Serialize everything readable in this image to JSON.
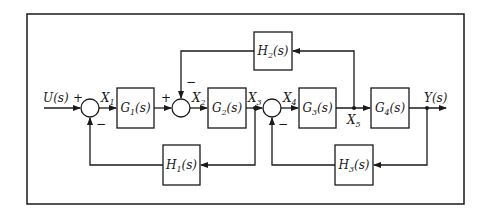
{
  "diagram": {
    "type": "control-system-block-diagram",
    "input": {
      "name": "U",
      "arg": "(s)"
    },
    "output": {
      "name": "Y",
      "arg": "(s)"
    },
    "forward_blocks": [
      {
        "id": "G1",
        "name": "G",
        "sub": "1",
        "arg": "(s)"
      },
      {
        "id": "G2",
        "name": "G",
        "sub": "2",
        "arg": "(s)"
      },
      {
        "id": "G3",
        "name": "G",
        "sub": "3",
        "arg": "(s)"
      },
      {
        "id": "G4",
        "name": "G",
        "sub": "4",
        "arg": "(s)"
      }
    ],
    "feedback_blocks": [
      {
        "id": "H1",
        "name": "H",
        "sub": "1",
        "arg": "(s)",
        "from": "X3",
        "to": "sum1"
      },
      {
        "id": "H2",
        "name": "H",
        "sub": "2",
        "arg": "(s)",
        "from": "X5",
        "to": "sum2"
      },
      {
        "id": "H3",
        "name": "H",
        "sub": "3",
        "arg": "(s)",
        "from": "Y",
        "to": "sum3"
      }
    ],
    "signals": [
      {
        "name": "X",
        "sub": "1"
      },
      {
        "name": "X",
        "sub": "2"
      },
      {
        "name": "X",
        "sub": "3"
      },
      {
        "name": "X",
        "sub": "4"
      },
      {
        "name": "X",
        "sub": "5"
      }
    ],
    "summing_junctions": [
      {
        "id": "sum1",
        "signs": {
          "input": "+",
          "feedback": "−"
        }
      },
      {
        "id": "sum2",
        "signs": {
          "input": "+",
          "feedback": "−"
        }
      },
      {
        "id": "sum3",
        "signs": {
          "feedback": "−"
        }
      }
    ],
    "colors": {
      "line": "#1a1a1a",
      "background": "#ffffff"
    }
  }
}
